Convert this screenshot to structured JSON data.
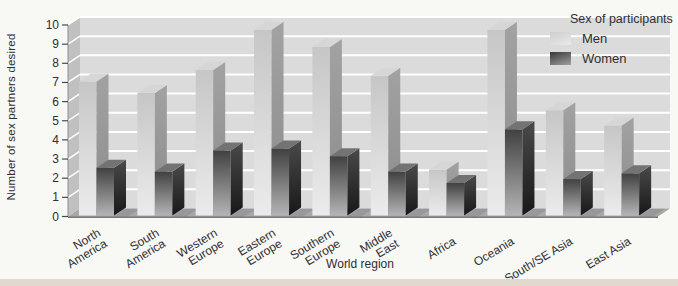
{
  "chart_data": {
    "type": "bar",
    "style": "3d-grouped-columns",
    "title": "",
    "xlabel": "World region",
    "ylabel": "Number of sex partners desired",
    "ylim": [
      0,
      10
    ],
    "yticks": [
      0,
      1,
      2,
      3,
      4,
      5,
      6,
      7,
      8,
      9,
      10
    ],
    "grid": "horizontal-white-lines-on-gray-wall",
    "categories": [
      "North America",
      "South America",
      "Western Europe",
      "Eastern Europe",
      "Southern Europe",
      "Middle East",
      "Africa",
      "Oceania",
      "South/SE Asia",
      "East Asia"
    ],
    "category_label_lines": [
      [
        "North",
        "America"
      ],
      [
        "South",
        "America"
      ],
      [
        "Western",
        "Europe"
      ],
      [
        "Eastern",
        "Europe"
      ],
      [
        "Southern",
        "Europe"
      ],
      [
        "Middle",
        "East"
      ],
      [
        "Africa"
      ],
      [
        "Oceania"
      ],
      [
        "South/SE Asia"
      ],
      [
        "East Asia"
      ]
    ],
    "series": [
      {
        "name": "Men",
        "values": [
          7.0,
          6.4,
          7.6,
          9.7,
          8.8,
          7.3,
          2.4,
          9.7,
          5.5,
          4.7
        ]
      },
      {
        "name": "Women",
        "values": [
          2.5,
          2.3,
          3.4,
          3.5,
          3.1,
          2.3,
          1.7,
          4.5,
          1.9,
          2.2
        ]
      }
    ],
    "legend": {
      "title": "Sex of participants",
      "entries": [
        "Men",
        "Women"
      ],
      "position": "top-right-inside"
    }
  },
  "colors": {
    "background": "#f8f8f5",
    "bottom_strip": "#e2d9ce",
    "wall": "#dbdbdb",
    "left_wall": "#c0c0c0",
    "roof": "#cbcbcb",
    "floor": "#a8a8a8",
    "floor_edge": "#7a7a7a",
    "grid_line": "#ffffff",
    "text": "#2f2f2f",
    "men_front_top": "#c6c6c6",
    "men_front_bottom": "#ebebeb",
    "men_side_top": "#a2a2a2",
    "men_side_bottom": "#8b8b8b",
    "men_top_face": "#d6d6d6",
    "women_front_top": "#414141",
    "women_front_bottom": "#b4b4b4",
    "women_side_top": "#4a4a4a",
    "women_side_bottom": "#181818",
    "women_top_face": "#737373"
  }
}
